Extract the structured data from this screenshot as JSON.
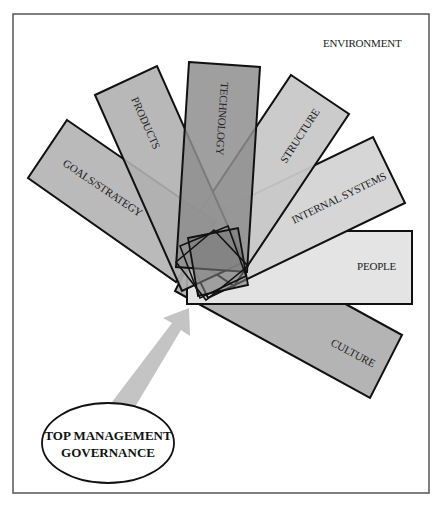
{
  "diagram": {
    "environment_label": "ENVIRONMENT",
    "center_source": {
      "line1": "TOP MANAGEMENT",
      "line2": "GOVERNANCE"
    },
    "elements": [
      {
        "id": "goals",
        "label": "GOALS/STRATEGY"
      },
      {
        "id": "products",
        "label": "PRODUCTS"
      },
      {
        "id": "technology",
        "label": "TECHNOLOGY"
      },
      {
        "id": "structure",
        "label": "STRUCTURE"
      },
      {
        "id": "internal_systems",
        "label": "INTERNAL SYSTEMS"
      },
      {
        "id": "people",
        "label": "PEOPLE"
      },
      {
        "id": "culture",
        "label": "CULTURE"
      }
    ],
    "colors": {
      "frame": "#555555",
      "fill_light": "#d6d6d6",
      "fill_mid": "#b4b4b4",
      "fill_dark": "#8e8e8e",
      "fill_lightest": "#e4e4e4",
      "arrow": "#c4c4c4",
      "stroke": "#111111"
    }
  }
}
